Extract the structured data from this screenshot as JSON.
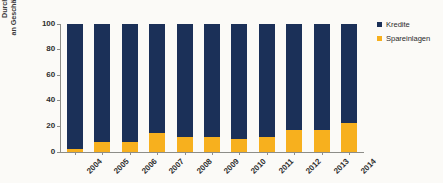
{
  "figure": {
    "background_color": "#fbfaf7",
    "cropped_title_fragment": "",
    "axis_color": "#8d8d88"
  },
  "legend": {
    "position": "right-top",
    "entries": [
      {
        "label": "Kredite",
        "color": "#1b3058"
      },
      {
        "label": "Spareinlagen",
        "color": "#f7b01e"
      }
    ]
  },
  "y_axis": {
    "title_lines": [
      "Durchschnittlicher Anteil",
      "an Geschäftsvolumen von MFI in %",
      "( Median )"
    ],
    "ticks": [
      "0",
      "20",
      "40",
      "60",
      "80",
      "100"
    ]
  },
  "chart_data": {
    "type": "bar",
    "title": "",
    "xlabel": "",
    "ylabel": "Durchschnittlicher Anteil an Geschäftsvolumen von MFI in % ( Median )",
    "ylim": [
      0,
      100
    ],
    "ytick_values": [
      0,
      20,
      40,
      60,
      80,
      100
    ],
    "grid": false,
    "stacked": true,
    "stack_total": 100,
    "legend_position": "right-top",
    "categories": [
      "2004",
      "2005",
      "2006",
      "2007",
      "2008",
      "2009",
      "2010",
      "2011",
      "2012",
      "2013",
      "2014"
    ],
    "series": [
      {
        "name": "Spareinlagen",
        "color": "#f7b01e",
        "values": [
          2,
          8,
          8,
          15,
          12,
          12,
          10,
          12,
          17,
          17,
          23
        ]
      },
      {
        "name": "Kredite",
        "color": "#1b3058",
        "values": [
          98,
          92,
          92,
          85,
          88,
          88,
          90,
          88,
          83,
          83,
          77
        ]
      }
    ]
  }
}
